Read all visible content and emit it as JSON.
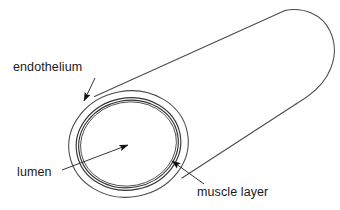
{
  "diagram": {
    "background_color": "#ffffff",
    "stroke_color": "#3a3a3a",
    "text_color": "#1a1a1a",
    "labels": {
      "endothelium": "endothelium",
      "lumen": "lumen",
      "muscle_layer": "muscle layer"
    },
    "structures": [
      {
        "name": "muscle layer",
        "description": "outermost wall of the vessel, drawn as the outer ellipse and the long tube body"
      },
      {
        "name": "endothelium",
        "description": "thin double-line inner lining between the muscle layer and the lumen"
      },
      {
        "name": "lumen",
        "description": "hollow central cavity of the vessel"
      }
    ],
    "annotations": [
      {
        "label": "endothelium",
        "leader_from": [
          95,
          78
        ],
        "arrow_tip": [
          84,
          101
        ],
        "points_to": "endothelium"
      },
      {
        "label": "lumen",
        "leader_from": [
          62,
          170
        ],
        "arrow_tip": [
          128,
          145
        ],
        "points_to": "lumen"
      },
      {
        "label": "muscle layer",
        "leader_from": [
          204,
          184
        ],
        "arrow_tip": [
          172,
          161
        ],
        "points_to": "muscle layer"
      }
    ]
  }
}
